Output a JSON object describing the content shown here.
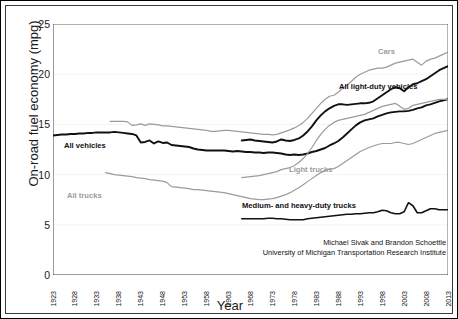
{
  "chart_data": {
    "type": "line",
    "title": "",
    "xlabel": "Year",
    "ylabel": "On-road fuel economy (mpg)",
    "xlim": [
      1923,
      2013
    ],
    "ylim": [
      0,
      25
    ],
    "yticks": [
      25,
      20,
      15,
      10,
      5,
      0
    ],
    "xticks": [
      "1923",
      "1928",
      "1933",
      "1938",
      "1943",
      "1948",
      "1953",
      "1958",
      "1963",
      "1968",
      "1973",
      "1978",
      "1983",
      "1988",
      "1993",
      "1998",
      "2003",
      "2008",
      "2013"
    ],
    "grid": "horizontal-faint",
    "legend": "inline-annotations",
    "annotations": [
      {
        "text": "Cars",
        "color": "#9b9b9b",
        "x_px": 376,
        "y_px": 45
      },
      {
        "text": "All light-duty vehicles",
        "color": "#111111",
        "x_px": 337,
        "y_px": 80
      },
      {
        "text": "All vehicles",
        "color": "#111111",
        "x_px": 62,
        "y_px": 139
      },
      {
        "text": "Light trucks",
        "color": "#9b9b9b",
        "x_px": 287,
        "y_px": 163
      },
      {
        "text": "All trucks",
        "color": "#9b9b9b",
        "x_px": 65,
        "y_px": 189
      },
      {
        "text": "Medium- and heavy-duty trucks",
        "color": "#111111",
        "x_px": 240,
        "y_px": 199
      }
    ],
    "credit_lines": [
      "Michael Sivak and Brandon Schoettle",
      "University of Michigan Transportation Research Institute"
    ],
    "series": [
      {
        "name": "All vehicles",
        "color": "#111111",
        "width": 1.9,
        "x_start": 1923,
        "values": [
          13.9,
          13.95,
          14.0,
          14.0,
          14.05,
          14.05,
          14.1,
          14.1,
          14.15,
          14.15,
          14.2,
          14.2,
          14.2,
          14.2,
          14.25,
          14.2,
          14.15,
          14.1,
          14.05,
          13.9,
          13.2,
          13.25,
          13.4,
          13.1,
          13.3,
          13.15,
          13.2,
          12.95,
          12.9,
          12.85,
          12.8,
          12.75,
          12.6,
          12.5,
          12.45,
          12.4,
          12.4,
          12.4,
          12.4,
          12.4,
          12.35,
          12.3,
          12.35,
          12.3,
          12.25,
          12.25,
          12.2,
          12.2,
          12.15,
          12.2,
          12.2,
          12.15,
          12.1,
          12.0,
          11.95,
          12.0,
          11.95,
          12.0,
          12.1,
          12.25,
          12.35,
          12.5,
          12.65,
          12.9,
          13.1,
          13.35,
          13.7,
          14.1,
          14.5,
          14.9,
          15.2,
          15.4,
          15.5,
          15.6,
          15.8,
          15.95,
          16.1,
          16.2,
          16.25,
          16.3,
          16.3,
          16.35,
          16.45,
          16.6,
          16.7,
          16.9,
          17.0,
          17.15,
          17.3,
          17.4,
          17.5
        ]
      },
      {
        "name": "Cars",
        "color": "#9b9b9b",
        "width": 1.2,
        "x_start": 1936,
        "values": [
          15.3,
          15.3,
          15.3,
          15.3,
          15.25,
          14.9,
          14.95,
          15.05,
          14.9,
          15.05,
          15.0,
          14.95,
          14.85,
          14.85,
          14.8,
          14.75,
          14.7,
          14.65,
          14.6,
          14.55,
          14.5,
          14.45,
          14.4,
          14.3,
          14.3,
          14.35,
          14.4,
          14.4,
          14.35,
          14.3,
          14.25,
          14.2,
          14.15,
          14.1,
          14.05,
          14.0,
          14.0,
          13.95,
          14.0,
          14.15,
          14.3,
          14.45,
          14.65,
          14.9,
          15.2,
          15.6,
          16.1,
          16.6,
          17.1,
          17.5,
          17.8,
          17.9,
          18.2,
          18.6,
          18.9,
          19.3,
          19.7,
          20.0,
          20.2,
          20.4,
          20.5,
          20.6,
          20.6,
          20.7,
          20.9,
          21.1,
          21.2,
          21.3,
          21.4,
          21.5,
          21.2,
          20.9,
          21.3,
          21.5,
          21.6,
          21.8,
          22.0,
          22.2,
          22.6,
          23.0,
          23.2
        ]
      },
      {
        "name": "All light-duty vehicles",
        "color": "#111111",
        "width": 1.9,
        "x_start": 1966,
        "values": [
          13.4,
          13.45,
          13.5,
          13.4,
          13.35,
          13.3,
          13.25,
          13.2,
          13.3,
          13.5,
          13.4,
          13.35,
          13.45,
          13.6,
          13.9,
          14.3,
          14.8,
          15.4,
          15.9,
          16.3,
          16.6,
          16.85,
          17.0,
          17.0,
          16.95,
          17.0,
          17.05,
          17.1,
          17.1,
          17.15,
          17.3,
          17.6,
          17.9,
          18.2,
          18.5,
          18.7,
          18.6,
          18.3,
          18.7,
          19.0,
          19.1,
          19.3,
          19.5,
          19.8,
          20.1,
          20.4,
          20.6,
          20.8
        ]
      },
      {
        "name": "All trucks",
        "color": "#9b9b9b",
        "width": 1.2,
        "x_start": 1935,
        "values": [
          10.2,
          10.1,
          10.0,
          9.95,
          9.9,
          9.85,
          9.8,
          9.7,
          9.65,
          9.6,
          9.5,
          9.45,
          9.4,
          9.35,
          9.2,
          8.8,
          8.75,
          8.7,
          8.65,
          8.6,
          8.5,
          8.5,
          8.45,
          8.4,
          8.35,
          8.3,
          8.25,
          8.2,
          8.1,
          8.0,
          7.9,
          7.8,
          7.7,
          7.6,
          7.55,
          7.5,
          7.5,
          7.55,
          7.6,
          7.7,
          7.85,
          8.0,
          8.2,
          8.45,
          8.7,
          9.0,
          9.3,
          9.6,
          9.9,
          10.2,
          10.4,
          10.55,
          10.6,
          10.8,
          11.1,
          11.4,
          11.7,
          12.0,
          12.3,
          12.5,
          12.7,
          12.85,
          13.0,
          13.1,
          13.1,
          13.1,
          13.2,
          13.2,
          13.1,
          13.0,
          13.1,
          13.3,
          13.5,
          13.7,
          13.9,
          14.1,
          14.2,
          14.3,
          14.4
        ]
      },
      {
        "name": "Light trucks",
        "color": "#9b9b9b",
        "width": 1.2,
        "x_start": 1966,
        "values": [
          9.7,
          9.75,
          9.8,
          9.85,
          9.9,
          10.0,
          10.1,
          10.2,
          10.3,
          10.5,
          10.6,
          10.7,
          10.9,
          11.2,
          11.6,
          12.1,
          12.7,
          13.4,
          14.0,
          14.5,
          14.9,
          15.2,
          15.4,
          15.5,
          15.6,
          15.7,
          15.8,
          15.9,
          16.0,
          16.2,
          16.4,
          16.6,
          16.8,
          16.9,
          17.0,
          17.1,
          16.8,
          16.5,
          16.6,
          16.9,
          17.0,
          17.1,
          17.2,
          17.3,
          17.4,
          17.5,
          17.5,
          17.5
        ]
      },
      {
        "name": "Medium- and heavy-duty trucks",
        "color": "#111111",
        "width": 1.6,
        "x_start": 1966,
        "values": [
          5.6,
          5.6,
          5.6,
          5.6,
          5.6,
          5.6,
          5.65,
          5.65,
          5.6,
          5.6,
          5.55,
          5.5,
          5.5,
          5.5,
          5.5,
          5.6,
          5.65,
          5.7,
          5.75,
          5.8,
          5.85,
          5.9,
          5.95,
          6.0,
          6.05,
          6.05,
          6.1,
          6.1,
          6.15,
          6.2,
          6.2,
          6.3,
          6.45,
          6.4,
          6.2,
          6.1,
          6.1,
          6.3,
          7.2,
          6.9,
          6.2,
          6.2,
          6.4,
          6.6,
          6.6,
          6.5,
          6.5,
          6.5
        ]
      }
    ]
  }
}
